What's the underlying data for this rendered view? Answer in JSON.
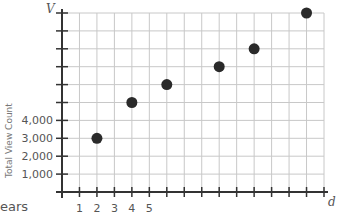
{
  "chart_data": {
    "type": "scatter",
    "title": "",
    "xlabel": "d",
    "ylabel": "Total View Count",
    "y_axis_letter": "V",
    "x_axis_letter": "d",
    "partial_label": "ears",
    "x_tick_labels": [
      "1",
      "2",
      "3",
      "4",
      "5"
    ],
    "y_tick_labels": [
      "1,000",
      "2,000",
      "3,000",
      "4,000"
    ],
    "xlim": [
      0,
      15
    ],
    "ylim": [
      0,
      10000
    ],
    "grid": true,
    "x_step": 1,
    "y_step": 1000,
    "points": [
      {
        "x": 2,
        "y": 3000
      },
      {
        "x": 4,
        "y": 5000
      },
      {
        "x": 6,
        "y": 6000
      },
      {
        "x": 9,
        "y": 7000
      },
      {
        "x": 11,
        "y": 8000
      },
      {
        "x": 14,
        "y": 10000
      }
    ],
    "colors": {
      "grid": "#c8c8c8",
      "axis": "#333333",
      "point": "#2a2a2a"
    }
  }
}
